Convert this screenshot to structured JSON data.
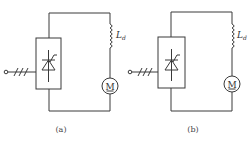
{
  "figure": {
    "panels": [
      {
        "id": "a",
        "caption": "(a)",
        "components": {
          "converter": "thyristor converter block",
          "inductor": {
            "label": "L",
            "subscript": "d"
          },
          "motor": {
            "label": "M"
          },
          "input": "three-phase AC input"
        }
      },
      {
        "id": "b",
        "caption": "(b)",
        "components": {
          "converter": "thyristor converter block",
          "inductor": {
            "label": "L",
            "subscript": "d"
          },
          "motor": {
            "label": "M"
          },
          "input": "three-phase AC input"
        }
      }
    ]
  }
}
